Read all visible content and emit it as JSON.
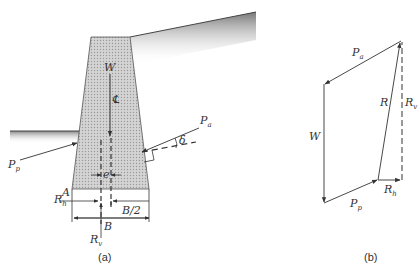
{
  "figure": {
    "panel_a": {
      "caption": "(a)",
      "labels": {
        "weight": "W",
        "centerline": "℄",
        "active_force": {
          "main": "P",
          "sub": "a"
        },
        "delta": "δ",
        "passive_force": {
          "main": "P",
          "sub": "p"
        },
        "point_a": "A",
        "r_h": {
          "main": "R",
          "sub": "h"
        },
        "eccentricity": "e",
        "half_base": "B/2",
        "base": "B",
        "r_v": {
          "main": "R",
          "sub": "v"
        }
      }
    },
    "panel_b": {
      "caption": "(b)",
      "labels": {
        "active_force": {
          "main": "P",
          "sub": "a"
        },
        "weight": "W",
        "resultant": "R",
        "r_v": {
          "main": "R",
          "sub": "v"
        },
        "r_h": {
          "main": "R",
          "sub": "h"
        },
        "passive_force": {
          "main": "P",
          "sub": "p"
        }
      }
    }
  },
  "colors": {
    "line": "#333333",
    "wall_fill": "#c8c8c8",
    "soil_dark": "#888888"
  }
}
